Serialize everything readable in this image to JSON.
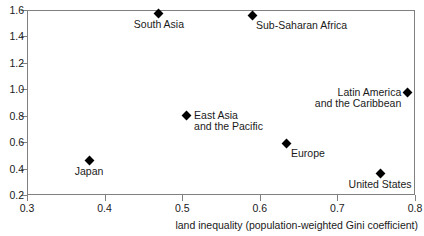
{
  "chart_data": {
    "type": "scatter",
    "title": "",
    "xlabel": "land inequality (population-weighted Gini coefficient)",
    "ylabel": "",
    "xlim": [
      0.3,
      0.8
    ],
    "ylim": [
      0.2,
      1.6
    ],
    "xticks": [
      "0.3",
      "0.4",
      "0.5",
      "0.6",
      "0.7",
      "0.8"
    ],
    "yticks": [
      "0.2",
      "0.4",
      "0.6",
      "0.8",
      "1.0",
      "1.2",
      "1.4",
      "1.6"
    ],
    "grid": false,
    "legend": "none",
    "marker_style": "filled-diamond",
    "marker_color": "#000000",
    "points": [
      {
        "label": "Japan",
        "x": 0.38,
        "y": 0.46,
        "label_pos": "below"
      },
      {
        "label": "South Asia",
        "x": 0.47,
        "y": 1.57,
        "label_pos": "below"
      },
      {
        "label": "East Asia\nand the Pacific",
        "x": 0.505,
        "y": 0.8,
        "label_pos": "right"
      },
      {
        "label": "Sub-Saharan Africa",
        "x": 0.59,
        "y": 1.56,
        "label_pos": "below-right"
      },
      {
        "label": "Europe",
        "x": 0.635,
        "y": 0.59,
        "label_pos": "below-right"
      },
      {
        "label": "United States",
        "x": 0.755,
        "y": 0.36,
        "label_pos": "below"
      },
      {
        "label": "Latin America\nand the Caribbean",
        "x": 0.79,
        "y": 0.975,
        "label_pos": "left"
      }
    ]
  },
  "axes": {
    "x_title": "land inequality (population-weighted Gini coefficient)",
    "x_tick_labels": [
      "0.3",
      "0.4",
      "0.5",
      "0.6",
      "0.7",
      "0.8"
    ],
    "y_tick_labels": [
      "0.2",
      "0.4",
      "0.6",
      "0.8",
      "1.0",
      "1.2",
      "1.4",
      "1.6"
    ]
  },
  "point_labels": {
    "japan": "Japan",
    "south_asia": "South Asia",
    "east_asia": "East Asia\nand the Pacific",
    "sub_saharan_africa": "Sub-Saharan Africa",
    "europe": "Europe",
    "united_states": "United States",
    "latin_america": "Latin America\nand the Caribbean"
  },
  "colors": {
    "marker": "#000000",
    "axis": "#808080",
    "text": "#1a1a1a",
    "background": "#ffffff"
  }
}
